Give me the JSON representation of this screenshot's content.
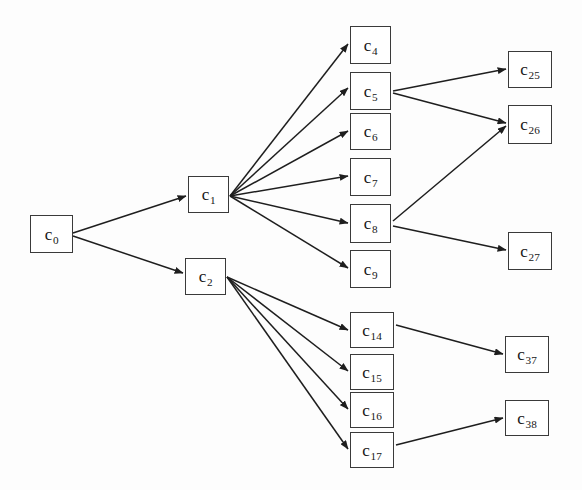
{
  "diagram": {
    "type": "directed-tree",
    "background_color": "#fdfdfd",
    "node_fill": "#ffffff",
    "node_stroke": "#3a3a3a",
    "edge_color": "#1e1e1e",
    "canvas": {
      "width": 582,
      "height": 490
    },
    "nodes": [
      {
        "id": "c0",
        "base": "c",
        "sub": "0",
        "x": 30,
        "y": 215,
        "w": 43,
        "h": 38
      },
      {
        "id": "c1",
        "base": "c",
        "sub": "1",
        "x": 188,
        "y": 176,
        "w": 41,
        "h": 37
      },
      {
        "id": "c2",
        "base": "c",
        "sub": "2",
        "x": 185,
        "y": 258,
        "w": 41,
        "h": 37
      },
      {
        "id": "c4",
        "base": "c",
        "sub": "4",
        "x": 350,
        "y": 26,
        "w": 41,
        "h": 38
      },
      {
        "id": "c5",
        "base": "c",
        "sub": "5",
        "x": 350,
        "y": 72,
        "w": 41,
        "h": 38
      },
      {
        "id": "c6",
        "base": "c",
        "sub": "6",
        "x": 350,
        "y": 113,
        "w": 41,
        "h": 37
      },
      {
        "id": "c7",
        "base": "c",
        "sub": "7",
        "x": 350,
        "y": 158,
        "w": 41,
        "h": 38
      },
      {
        "id": "c8",
        "base": "c",
        "sub": "8",
        "x": 350,
        "y": 204,
        "w": 41,
        "h": 39
      },
      {
        "id": "c9",
        "base": "c",
        "sub": "9",
        "x": 350,
        "y": 250,
        "w": 41,
        "h": 38
      },
      {
        "id": "c14",
        "base": "c",
        "sub": "14",
        "x": 350,
        "y": 312,
        "w": 44,
        "h": 36
      },
      {
        "id": "c15",
        "base": "c",
        "sub": "15",
        "x": 350,
        "y": 354,
        "w": 44,
        "h": 36
      },
      {
        "id": "c16",
        "base": "c",
        "sub": "16",
        "x": 350,
        "y": 392,
        "w": 44,
        "h": 36
      },
      {
        "id": "c17",
        "base": "c",
        "sub": "17",
        "x": 350,
        "y": 432,
        "w": 44,
        "h": 36
      },
      {
        "id": "c25",
        "base": "c",
        "sub": "25",
        "x": 508,
        "y": 51,
        "w": 44,
        "h": 37
      },
      {
        "id": "c26",
        "base": "c",
        "sub": "26",
        "x": 508,
        "y": 105,
        "w": 44,
        "h": 39
      },
      {
        "id": "c27",
        "base": "c",
        "sub": "27",
        "x": 508,
        "y": 232,
        "w": 44,
        "h": 38
      },
      {
        "id": "c37",
        "base": "c",
        "sub": "37",
        "x": 505,
        "y": 336,
        "w": 44,
        "h": 37
      },
      {
        "id": "c38",
        "base": "c",
        "sub": "38",
        "x": 505,
        "y": 400,
        "w": 44,
        "h": 36
      }
    ],
    "edges": [
      {
        "from": "c0",
        "to": "c1",
        "x1": 73,
        "y1": 233,
        "x2": 186,
        "y2": 196
      },
      {
        "from": "c0",
        "to": "c2",
        "x1": 73,
        "y1": 236,
        "x2": 183,
        "y2": 273
      },
      {
        "from": "c1",
        "to": "c4",
        "x1": 230,
        "y1": 196,
        "x2": 348,
        "y2": 44
      },
      {
        "from": "c1",
        "to": "c5",
        "x1": 230,
        "y1": 196,
        "x2": 348,
        "y2": 88
      },
      {
        "from": "c1",
        "to": "c6",
        "x1": 230,
        "y1": 196,
        "x2": 348,
        "y2": 131
      },
      {
        "from": "c1",
        "to": "c7",
        "x1": 230,
        "y1": 196,
        "x2": 348,
        "y2": 176
      },
      {
        "from": "c1",
        "to": "c8",
        "x1": 230,
        "y1": 196,
        "x2": 348,
        "y2": 223
      },
      {
        "from": "c1",
        "to": "c9",
        "x1": 230,
        "y1": 196,
        "x2": 348,
        "y2": 268
      },
      {
        "from": "c2",
        "to": "c14",
        "x1": 227,
        "y1": 277,
        "x2": 348,
        "y2": 330
      },
      {
        "from": "c2",
        "to": "c15",
        "x1": 227,
        "y1": 277,
        "x2": 348,
        "y2": 371
      },
      {
        "from": "c2",
        "to": "c16",
        "x1": 227,
        "y1": 277,
        "x2": 348,
        "y2": 409
      },
      {
        "from": "c2",
        "to": "c17",
        "x1": 227,
        "y1": 277,
        "x2": 348,
        "y2": 449
      },
      {
        "from": "c5",
        "to": "c25",
        "x1": 393,
        "y1": 91,
        "x2": 506,
        "y2": 69
      },
      {
        "from": "c5",
        "to": "c26",
        "x1": 393,
        "y1": 93,
        "x2": 506,
        "y2": 123
      },
      {
        "from": "c8",
        "to": "c26",
        "x1": 393,
        "y1": 221,
        "x2": 506,
        "y2": 126
      },
      {
        "from": "c8",
        "to": "c27",
        "x1": 393,
        "y1": 226,
        "x2": 506,
        "y2": 250
      },
      {
        "from": "c14",
        "to": "c37",
        "x1": 396,
        "y1": 325,
        "x2": 503,
        "y2": 354
      },
      {
        "from": "c17",
        "to": "c38",
        "x1": 396,
        "y1": 445,
        "x2": 503,
        "y2": 418
      }
    ]
  }
}
